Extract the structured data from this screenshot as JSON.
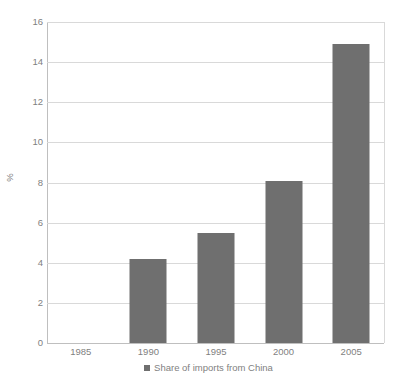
{
  "chart_data": {
    "type": "bar",
    "title": "",
    "subtitle": "",
    "xlabel": "",
    "ylabel": "%",
    "categories": [
      "1985",
      "1990",
      "1995",
      "2000",
      "2005"
    ],
    "series": [
      {
        "name": "Share of imports from China",
        "values": [
          0,
          4.2,
          5.5,
          8.1,
          14.9
        ],
        "color": "#6f6f6f"
      }
    ],
    "ylim": [
      0,
      16
    ],
    "yticks": [
      0,
      2,
      4,
      6,
      8,
      10,
      12,
      14,
      16
    ],
    "ytick_labels": [
      "0",
      "2",
      "4",
      "6",
      "8",
      "10",
      "12",
      "14",
      "16"
    ],
    "grid": true,
    "legend_position": "bottom",
    "legend_entries": [
      "Share of imports from China"
    ],
    "annotations": []
  },
  "colors": {
    "bar": "#6f6f6f",
    "gridline": "#d9d9d9",
    "axis": "#bfbfbf",
    "text": "#7f7f7f",
    "background": "#ffffff"
  },
  "legend": {
    "marker_icon": "square-marker-icon"
  }
}
